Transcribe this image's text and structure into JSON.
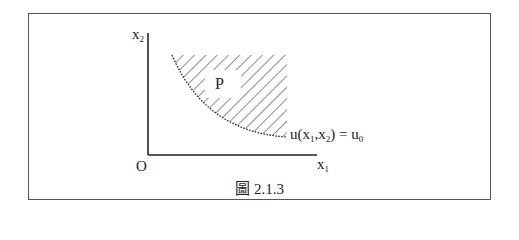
{
  "figure": {
    "caption": "圖 2.1.3",
    "y_axis_label": "x",
    "y_axis_sub": "2",
    "x_axis_label": "x",
    "x_axis_sub": "1",
    "origin_label": "O",
    "region_label": "P",
    "curve_label": {
      "func": "u",
      "open": "(",
      "arg1": "x",
      "arg1_sub": "1",
      "comma": ",",
      "arg2": "x",
      "arg2_sub": "2",
      "close": ")",
      "equals": " = ",
      "rhs": "u",
      "rhs_sub": "0"
    },
    "colors": {
      "line": "#222222",
      "frame": "#555555",
      "hatch": "#222222"
    }
  }
}
